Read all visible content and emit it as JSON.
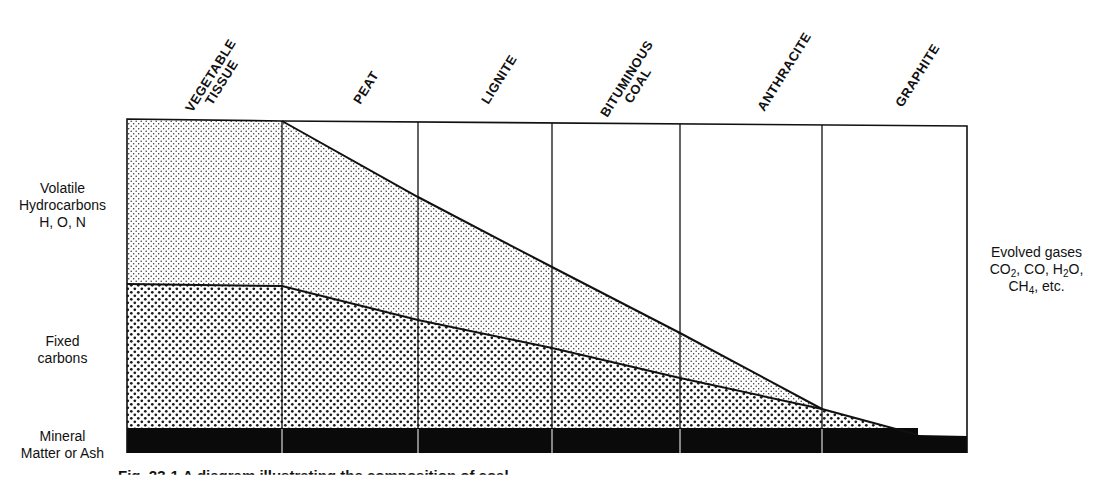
{
  "diagram": {
    "columns": [
      {
        "label_line1": "VEGETABLE",
        "label_line2": "TISSUE"
      },
      {
        "label_line1": "PEAT",
        "label_line2": ""
      },
      {
        "label_line1": "LIGNITE",
        "label_line2": ""
      },
      {
        "label_line1": "BITUMINOUS",
        "label_line2": "COAL"
      },
      {
        "label_line1": "ANTHRACITE",
        "label_line2": ""
      },
      {
        "label_line1": "GRAPHITE",
        "label_line2": ""
      }
    ],
    "left_labels": {
      "volatile": {
        "line1": "Volatile",
        "line2": "Hydrocarbons",
        "line3": "H, O, N"
      },
      "fixed": {
        "line1": "Fixed",
        "line2": "carbons"
      },
      "mineral": {
        "line1": "Mineral",
        "line2": "Matter or Ash"
      }
    },
    "right_label": {
      "line1": "Evolved gases",
      "line2_parts": [
        "CO",
        "2",
        ", CO, H",
        "2",
        "O,"
      ],
      "line3_parts": [
        "CH",
        "4",
        ", etc."
      ]
    },
    "caption": "Fig. 23-1  A diagram illustrating the composition of coal",
    "layers": [
      {
        "name": "Volatile Hydrocarbons",
        "pattern": "fine-stipple"
      },
      {
        "name": "Fixed carbons",
        "pattern": "coarse-stipple"
      },
      {
        "name": "Mineral Matter or Ash",
        "pattern": "solid-black"
      },
      {
        "name": "Evolved gases",
        "pattern": "white"
      }
    ],
    "colors": {
      "ink": "#111111",
      "paper": "#ffffff",
      "ash": "#0a0a0a"
    }
  }
}
